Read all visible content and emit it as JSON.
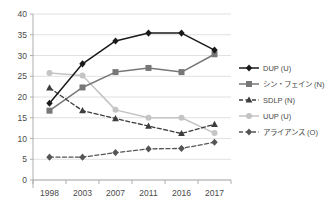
{
  "chart_data": {
    "type": "line",
    "title": "",
    "xlabel": "",
    "ylabel": "",
    "categories": [
      "1998",
      "2003",
      "2007",
      "2011",
      "2016",
      "2017"
    ],
    "ylim": [
      0,
      40
    ],
    "ytick_step": 5,
    "yticks": [
      "0",
      "5",
      "10",
      "15",
      "20",
      "25",
      "30",
      "35",
      "40"
    ],
    "grid": "horizontal",
    "legend_position": "right",
    "series": [
      {
        "name": "DUP (U)",
        "values": [
          18.5,
          28.0,
          33.5,
          35.4,
          35.4,
          31.3
        ],
        "color": "#1a1a1a",
        "dash": "solid",
        "marker": "diamond"
      },
      {
        "name": "シン・フェイン (N)",
        "values": [
          16.7,
          22.3,
          26.0,
          27.0,
          26.0,
          30.3
        ],
        "color": "#777777",
        "dash": "solid",
        "marker": "square"
      },
      {
        "name": "SDLP (N)",
        "values": [
          22.2,
          16.7,
          14.8,
          13.0,
          11.2,
          13.4
        ],
        "color": "#3d3d3d",
        "dash": "dashed",
        "marker": "triangle"
      },
      {
        "name": "UUP (U)",
        "values": [
          25.8,
          25.2,
          16.9,
          15.0,
          15.0,
          11.3
        ],
        "color": "#c4c4c4",
        "dash": "solid",
        "marker": "circle"
      },
      {
        "name": "アライアンス (O)",
        "values": [
          5.5,
          5.5,
          6.6,
          7.5,
          7.6,
          9.1
        ],
        "color": "#555555",
        "dash": "dashed",
        "marker": "diamond"
      }
    ]
  },
  "axis": {
    "gridline_color": "#d9d9d9",
    "axis_color": "#a6a6a6"
  }
}
